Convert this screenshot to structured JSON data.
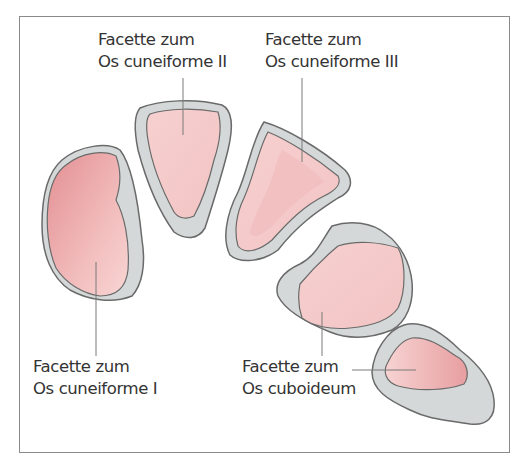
{
  "figure": {
    "colors": {
      "frame": "#8a8a8a",
      "bone_fill": "#d6d8d8",
      "bone_outline": "#6e6e6e",
      "facet_fill": "#f3c6c6",
      "facet_dark": "#e59a9c",
      "leader_line": "#7a7a7a",
      "text": "#333333"
    },
    "labels": {
      "cuneiforme_ii": {
        "line1": "Facette zum",
        "line2": "Os cuneiforme II"
      },
      "cuneiforme_iii": {
        "line1": "Facette zum",
        "line2": "Os cuneiforme III"
      },
      "cuneiforme_i": {
        "line1": "Facette zum",
        "line2": "Os cuneiforme I"
      },
      "cuboideum": {
        "line1": "Facette zum",
        "line2": "Os cuboideum"
      }
    }
  }
}
